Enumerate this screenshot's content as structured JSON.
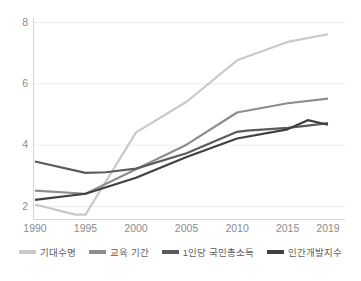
{
  "chart_data": {
    "type": "line",
    "title": "",
    "xlabel": "",
    "ylabel": "",
    "x": [
      1990,
      1995,
      2000,
      2005,
      2010,
      2015,
      2019
    ],
    "xtick_labels": [
      "1990",
      "1995",
      "2000",
      "2005",
      "2010",
      "2015",
      "2019"
    ],
    "ytick_labels": [
      "2",
      "4",
      "6",
      "8"
    ],
    "yticks": [
      2,
      4,
      6,
      8
    ],
    "xlim": [
      1990,
      2019
    ],
    "ylim": [
      1.6,
      8.2
    ],
    "grid": true,
    "legend_position": "bottom",
    "series": [
      {
        "name": "기대수명",
        "color": "#c9c9c9",
        "x": [
          1990,
          1994,
          1995,
          2000,
          2005,
          2010,
          2015,
          2019
        ],
        "values": [
          2.05,
          1.72,
          1.72,
          4.4,
          5.4,
          6.75,
          7.35,
          7.6
        ]
      },
      {
        "name": "교육 기간",
        "color": "#8d8d8d",
        "x": [
          1990,
          1995,
          2000,
          2005,
          2010,
          2015,
          2019
        ],
        "values": [
          2.5,
          2.4,
          3.2,
          4.0,
          5.05,
          5.35,
          5.5
        ]
      },
      {
        "name": "1인당 국민총소득",
        "color": "#5b5b5b",
        "x": [
          1990,
          1995,
          1997,
          2000,
          2005,
          2010,
          2011,
          2015,
          2017,
          2019
        ],
        "values": [
          3.45,
          3.08,
          3.1,
          3.22,
          3.72,
          4.42,
          4.46,
          4.55,
          4.62,
          4.7
        ]
      },
      {
        "name": "인간개발지수",
        "color": "#404040",
        "x": [
          1990,
          1995,
          2000,
          2005,
          2010,
          2015,
          2017,
          2019
        ],
        "values": [
          2.2,
          2.4,
          2.92,
          3.6,
          4.2,
          4.5,
          4.8,
          4.65
        ]
      }
    ]
  },
  "legend": {
    "items": [
      {
        "label": "기대수명",
        "color": "#c9c9c9"
      },
      {
        "label": "교육 기간",
        "color": "#8d8d8d"
      },
      {
        "label": "1인당 국민총소득",
        "color": "#5b5b5b"
      },
      {
        "label": "인간개발지수",
        "color": "#404040"
      }
    ]
  },
  "axes": {
    "y_labels": [
      "8",
      "6",
      "4",
      "2"
    ],
    "x_labels": [
      "1990",
      "1995",
      "2000",
      "2005",
      "2010",
      "2015",
      "2019"
    ]
  }
}
